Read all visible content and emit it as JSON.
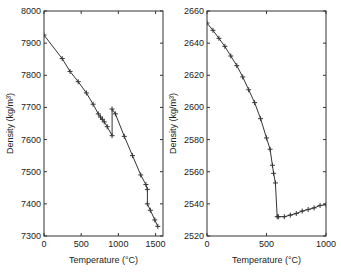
{
  "chart_data": [
    {
      "type": "line",
      "title": "",
      "xlabel": "Temperature (°C)",
      "ylabel": "Density (kg/m³)",
      "xlim": [
        0,
        1600
      ],
      "ylim": [
        7300,
        8000
      ],
      "xticks": [
        0,
        500,
        1000,
        1500
      ],
      "yticks": [
        7300,
        7400,
        7500,
        7600,
        7700,
        7800,
        7900,
        8000
      ],
      "grid": false,
      "marker": "+",
      "series": [
        {
          "name": "density",
          "x": [
            0,
            245,
            350,
            460,
            570,
            660,
            730,
            760,
            785,
            810,
            850,
            915,
            915,
            960,
            1080,
            1190,
            1300,
            1370,
            1390,
            1390,
            1430,
            1490,
            1530
          ],
          "y": [
            7925,
            7852,
            7812,
            7780,
            7745,
            7710,
            7680,
            7670,
            7663,
            7655,
            7640,
            7612,
            7695,
            7680,
            7610,
            7550,
            7490,
            7460,
            7445,
            7400,
            7380,
            7350,
            7330
          ]
        }
      ]
    },
    {
      "type": "line",
      "title": "",
      "xlabel": "Temperature (°C)",
      "ylabel": "Density (kg/m³)",
      "xlim": [
        0,
        1000
      ],
      "ylim": [
        2520,
        2660
      ],
      "xticks": [
        0,
        500,
        1000
      ],
      "yticks": [
        2520,
        2540,
        2560,
        2580,
        2600,
        2620,
        2640,
        2660
      ],
      "grid": false,
      "marker": "+",
      "series": [
        {
          "name": "density",
          "x": [
            0,
            50,
            100,
            150,
            200,
            250,
            300,
            350,
            400,
            450,
            500,
            530,
            550,
            560,
            575,
            590,
            600,
            650,
            700,
            750,
            800,
            850,
            900,
            950,
            1000
          ],
          "y": [
            2652.5,
            2648,
            2643,
            2638,
            2632,
            2626,
            2619,
            2611,
            2603,
            2593,
            2581,
            2574,
            2564,
            2559,
            2553,
            2532,
            2532,
            2532,
            2533,
            2534,
            2535.5,
            2536.5,
            2537.5,
            2539,
            2539.5
          ]
        }
      ]
    }
  ],
  "left": {
    "xlabel": "Temperature (°C)",
    "ylabel": "Density (kg/m³)",
    "xtick_labels": [
      "0",
      "500",
      "1000",
      "1500"
    ],
    "ytick_labels": [
      "7300",
      "7400",
      "7500",
      "7600",
      "7700",
      "7800",
      "7900",
      "8000"
    ]
  },
  "right": {
    "xlabel": "Temperature (°C)",
    "ylabel": "Density (kg/m³)",
    "xtick_labels": [
      "0",
      "500",
      "1000"
    ],
    "ytick_labels": [
      "2520",
      "2540",
      "2560",
      "2580",
      "2600",
      "2620",
      "2640",
      "2660"
    ]
  },
  "colors": {
    "line": "#333333",
    "axis": "#333333",
    "text": "#222222"
  }
}
